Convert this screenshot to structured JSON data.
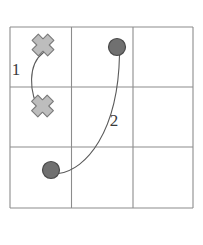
{
  "figure": {
    "canvas": {
      "width": 203,
      "height": 245,
      "background": "#ffffff"
    },
    "grid": {
      "rows": 3,
      "cols": 3,
      "left": 10,
      "top": 27,
      "right": 193,
      "bottom": 208,
      "x_lines": [
        10,
        71.5,
        133,
        193
      ],
      "y_lines": [
        27,
        87,
        147,
        208
      ],
      "line_color": "#8c8c8c",
      "line_width": 1.1
    },
    "markers": [
      {
        "id": "x-marker-1",
        "type": "cross",
        "cell": "r1c1",
        "x": 43,
        "y": 45,
        "size": 11,
        "fill": "#bdbdbd",
        "stroke": "#7a7a7a"
      },
      {
        "id": "x-marker-2",
        "type": "cross",
        "cell": "r2c1",
        "x": 42.5,
        "y": 106,
        "size": 11,
        "fill": "#bdbdbd",
        "stroke": "#7a7a7a"
      },
      {
        "id": "dot-marker-1",
        "type": "circle",
        "cell": "r1c2",
        "x": 117,
        "y": 47,
        "radius": 8.5,
        "fill": "#707070",
        "stroke": "#4a4a4a"
      },
      {
        "id": "dot-marker-2",
        "type": "circle",
        "cell": "r3c1",
        "x": 51,
        "y": 170,
        "radius": 8.5,
        "fill": "#707070",
        "stroke": "#4a4a4a"
      }
    ],
    "arcs": [
      {
        "id": "arc-1",
        "label": "1",
        "label_x": 16,
        "label_y": 75,
        "from": "x-marker-1",
        "to": "x-marker-2",
        "path": "M 43.5 52.5 C 28 64, 28 92, 41 113",
        "stroke": "#5a5a5a",
        "stroke_width": 1.1
      },
      {
        "id": "arc-2",
        "label": "2",
        "label_x": 114,
        "label_y": 126,
        "from": "dot-marker-2",
        "to": "dot-marker-1",
        "path": "M 58.5 173.5 C 86 170, 118 132, 119.5 55",
        "stroke": "#5a5a5a",
        "stroke_width": 1.1
      }
    ]
  }
}
